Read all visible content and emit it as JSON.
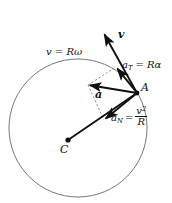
{
  "figure": {
    "background_color": "#ffffff",
    "stroke_color": "#111111",
    "circle": {
      "center_x": 78,
      "center_y": 128,
      "radius": 69,
      "stroke_color": "#555555",
      "stroke_width": 0.8
    },
    "points": [
      {
        "id": "C",
        "label": "C",
        "x": 68,
        "y": 140,
        "label_x": 62,
        "label_y": 145
      },
      {
        "id": "A",
        "label": "A",
        "x": 137,
        "y": 93,
        "label_x": 141,
        "label_y": 86
      }
    ],
    "vectors": [
      {
        "id": "v",
        "label": "v",
        "kind": "velocity",
        "from_x": 137,
        "from_y": 93,
        "to_x": 103,
        "to_y": 32,
        "bold": true
      },
      {
        "id": "a_T",
        "label_base": "a",
        "label_sub": "T",
        "label_rhs": "= Rα",
        "kind": "tangential-acceleration",
        "from_x": 137,
        "from_y": 93,
        "to_x": 116,
        "to_y": 67
      },
      {
        "id": "a_N",
        "label_base": "a",
        "label_sub": "N",
        "label_rhs_num": "v",
        "label_rhs_num_sup": "2",
        "label_rhs_den": "R",
        "kind": "normal-acceleration",
        "from_x": 137,
        "from_y": 93,
        "to_x": 104,
        "to_y": 120
      },
      {
        "id": "a",
        "label": "a",
        "kind": "resultant-acceleration",
        "from_x": 137,
        "from_y": 93,
        "to_x": 88,
        "to_y": 85,
        "bold": true
      }
    ],
    "radius_line": {
      "id": "CA",
      "from_x": 68,
      "from_y": 140,
      "to_x": 137,
      "to_y": 93
    },
    "dashed_construction": [
      {
        "from_x": 88,
        "from_y": 85,
        "to_x": 116,
        "to_y": 67
      },
      {
        "from_x": 88,
        "from_y": 85,
        "to_x": 104,
        "to_y": 120
      }
    ],
    "labels": {
      "speed": "v = Rω",
      "speed_x": 48,
      "speed_y": 53,
      "point_C": "C",
      "point_A": "A",
      "vector_v": "v",
      "vector_a": "a",
      "a_T_base": "a",
      "a_T_sub": "T",
      "a_T_rhs": "= Rα",
      "a_N_base": "a",
      "a_N_sub": "N",
      "a_N_eq": "=",
      "a_N_num": "v",
      "a_N_num_sup": "2",
      "a_N_den": "R"
    }
  }
}
